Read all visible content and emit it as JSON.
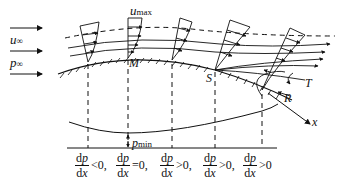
{
  "figure": {
    "colors": {
      "ink": "#111111",
      "background": "#ffffff"
    }
  },
  "freestream": {
    "velocity_label": "u",
    "velocity_sub": "∞",
    "pressure_label": "p",
    "pressure_sub": "∞"
  },
  "points": {
    "umax_label": "u",
    "umax_sub": "max",
    "M": "M",
    "S": "S",
    "R": "R",
    "T": "T",
    "x_axis": "x"
  },
  "pressure_plot": {
    "pmin_label": "p",
    "pmin_sub": "min"
  },
  "gradients": [
    {
      "num_d": "d",
      "num_v": "p",
      "den_d": "d",
      "den_v": "x",
      "relation": "<0,"
    },
    {
      "num_d": "d",
      "num_v": "p",
      "den_d": "d",
      "den_v": "x",
      "relation": "=0,"
    },
    {
      "num_d": "d",
      "num_v": "p",
      "den_d": "d",
      "den_v": "x",
      "relation": ">0,"
    },
    {
      "num_d": "d",
      "num_v": "p",
      "den_d": "d",
      "den_v": "x",
      "relation": ">0,"
    },
    {
      "num_d": "d",
      "num_v": "p",
      "den_d": "d",
      "den_v": "x",
      "relation": ">0"
    }
  ]
}
